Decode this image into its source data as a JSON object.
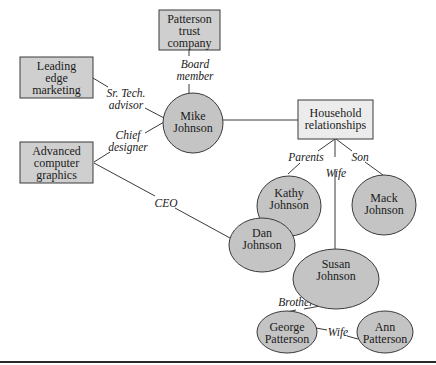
{
  "diagram": {
    "nodes": {
      "patterson_trust": [
        "Patterson",
        "trust",
        "company"
      ],
      "leading_edge": [
        "Leading",
        "edge",
        "marketing"
      ],
      "advanced_graphics": [
        "Advanced",
        "computer",
        "graphics"
      ],
      "mike": [
        "Mike",
        "Johnson"
      ],
      "household": [
        "Household",
        "relationships"
      ],
      "kathy": [
        "Kathy",
        "Johnson"
      ],
      "dan": [
        "Dan",
        "Johnson"
      ],
      "mack": [
        "Mack",
        "Johnson"
      ],
      "susan": [
        "Susan",
        "Johnson"
      ],
      "george": [
        "George",
        "Patterson"
      ],
      "ann": [
        "Ann",
        "Patterson"
      ]
    },
    "edges": {
      "board_member": [
        "Board",
        "member"
      ],
      "sr_tech_advisor": [
        "Sr. Tech.",
        "advisor"
      ],
      "chief_designer": [
        "Chief",
        "designer"
      ],
      "ceo": "CEO",
      "parents": "Parents",
      "wife_susan": "Wife",
      "son": "Son",
      "brother": "Brother",
      "wife_ann": "Wife"
    },
    "colors": {
      "entity_box": "#cfcfcf",
      "household_box": "#ececec",
      "person_ellipse": "#c4c4c4",
      "stroke": "#3a3a3a"
    }
  }
}
